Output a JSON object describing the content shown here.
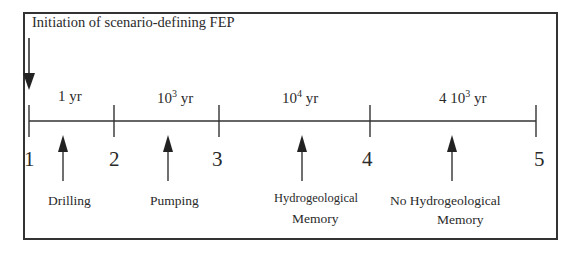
{
  "diagram": {
    "title": "Initiation of scenario-defining FEP",
    "durations": [
      {
        "base": "1",
        "exp": "",
        "unit": "yr",
        "prefix": ""
      },
      {
        "base": "10",
        "exp": "3",
        "unit": "yr",
        "prefix": ""
      },
      {
        "base": "10",
        "exp": "4",
        "unit": "yr",
        "prefix": ""
      },
      {
        "base": "10",
        "exp": "3",
        "unit": "yr",
        "prefix": "4 "
      }
    ],
    "nodes": [
      "1",
      "2",
      "3",
      "4",
      "5"
    ],
    "events": [
      {
        "line1": "Drilling",
        "line2": ""
      },
      {
        "line1": "Pumping",
        "line2": ""
      },
      {
        "line1": "Hydrogeological",
        "line2": "Memory"
      },
      {
        "line1": "No Hydrogeological",
        "line2": "Memory"
      }
    ],
    "colors": {
      "line": "#333333",
      "text": "#2a2a2a",
      "background": "#ffffff"
    }
  }
}
